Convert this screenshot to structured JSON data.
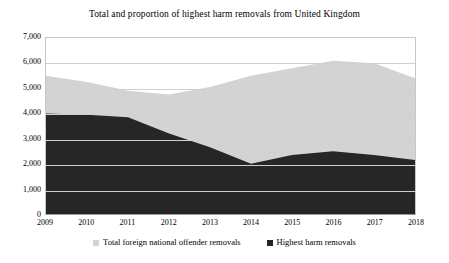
{
  "chart_data": {
    "type": "area",
    "title": "Total and proportion of highest harm removals from United Kingdom",
    "xlabel": "",
    "ylabel": "",
    "categories": [
      "2009",
      "2010",
      "2011",
      "2012",
      "2013",
      "2014",
      "2015",
      "2016",
      "2017",
      "2018"
    ],
    "x": [
      2009,
      2010,
      2011,
      2012,
      2013,
      2014,
      2015,
      2016,
      2017,
      2018
    ],
    "ylim": [
      0,
      7000
    ],
    "ytick_labels": [
      "0",
      "1,000",
      "2,000",
      "3,000",
      "4,000",
      "5,000",
      "6,000",
      "7,000"
    ],
    "ytick_values": [
      0,
      1000,
      2000,
      3000,
      4000,
      5000,
      6000,
      7000
    ],
    "grid": true,
    "stacked": false,
    "legend_position": "bottom",
    "series": [
      {
        "name": "Total foreign national offender removals",
        "color": "#d3d3d3",
        "values": [
          5500,
          5250,
          4900,
          4750,
          5050,
          5500,
          5800,
          6100,
          6000,
          5400
        ]
      },
      {
        "name": "Highest harm removals",
        "color": "#262626",
        "values": [
          4000,
          3950,
          3850,
          3200,
          2650,
          2000,
          2350,
          2500,
          2350,
          2150
        ]
      }
    ]
  },
  "legend": {
    "items": [
      {
        "label": "Total foreign national offender removals",
        "color": "#d3d3d3"
      },
      {
        "label": "Highest harm removals",
        "color": "#262626"
      }
    ]
  }
}
